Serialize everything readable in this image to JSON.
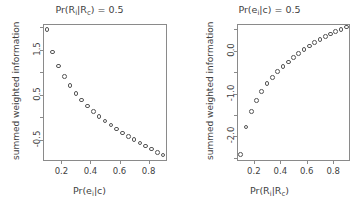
{
  "figure": {
    "background": "#ffffff",
    "point_color": "#555555",
    "frame_color": "#8a8a8a",
    "text_color": "#3f3f3f"
  },
  "chart_data": [
    {
      "type": "scatter",
      "panel": "left",
      "title": "Pr(R_i|R_c) = 0.5",
      "title_parts": {
        "prefix": "Pr(R",
        "sub1": "i",
        "mid": "|R",
        "sub2": "c",
        "suffix": ") = 0.5"
      },
      "xlabel": "Pr(e_i|c)",
      "xlabel_parts": {
        "prefix": "Pr(e",
        "sub1": "i",
        "suffix": "|c)"
      },
      "ylabel": "summed weighted information",
      "marker": "open-circle",
      "grid": false,
      "legend": null,
      "xlim": [
        0.08,
        0.92
      ],
      "ylim": [
        -0.95,
        2.05
      ],
      "xticks": [
        0.2,
        0.4,
        0.6,
        0.8
      ],
      "xticklabels": [
        "0.2",
        "0.4",
        "0.6",
        "0.8"
      ],
      "yticks": [
        -0.5,
        0.5,
        1.5
      ],
      "yticklabels": [
        "-0.5",
        "0.5",
        "1.5"
      ],
      "yticks_minor": [
        -1.0,
        0.0,
        1.0,
        2.0
      ],
      "x": [
        0.1,
        0.14,
        0.18,
        0.22,
        0.26,
        0.3,
        0.34,
        0.38,
        0.42,
        0.46,
        0.5,
        0.54,
        0.58,
        0.62,
        0.66,
        0.7,
        0.74,
        0.78,
        0.82,
        0.86,
        0.9
      ],
      "y": [
        1.95,
        1.45,
        1.14,
        0.9,
        0.7,
        0.53,
        0.38,
        0.25,
        0.13,
        0.02,
        -0.08,
        -0.17,
        -0.26,
        -0.35,
        -0.43,
        -0.5,
        -0.57,
        -0.64,
        -0.71,
        -0.78,
        -0.84
      ]
    },
    {
      "type": "scatter",
      "panel": "right",
      "title": "Pr(e_i|c) = 0.5",
      "title_parts": {
        "prefix": "Pr(e",
        "sub1": "i",
        "mid": "|c",
        "sub2": "",
        "suffix": ") = 0.5"
      },
      "xlabel": "Pr(R_i|R_c)",
      "xlabel_parts": {
        "prefix": "Pr(R",
        "sub1": "i",
        "mid": "|R",
        "sub2": "c",
        "suffix": ")"
      },
      "ylabel": "summed weighted information",
      "marker": "open-circle",
      "grid": false,
      "legend": null,
      "xlim": [
        0.08,
        0.92
      ],
      "ylim": [
        -2.55,
        0.6
      ],
      "xticks": [
        0.2,
        0.4,
        0.6,
        0.8
      ],
      "xticklabels": [
        "0.2",
        "0.4",
        "0.6",
        "0.8"
      ],
      "yticks": [
        -2.0,
        -1.0,
        0.0
      ],
      "yticklabels": [
        "-2.0",
        "-1.0",
        "0.0"
      ],
      "yticks_minor": [
        -2.5,
        -1.5,
        -0.5,
        0.5
      ],
      "x": [
        0.1,
        0.14,
        0.18,
        0.22,
        0.26,
        0.3,
        0.34,
        0.38,
        0.42,
        0.46,
        0.5,
        0.54,
        0.58,
        0.62,
        0.66,
        0.7,
        0.74,
        0.78,
        0.82,
        0.86,
        0.9
      ],
      "y": [
        -2.42,
        -1.78,
        -1.42,
        -1.16,
        -0.95,
        -0.77,
        -0.62,
        -0.49,
        -0.37,
        -0.26,
        -0.16,
        -0.06,
        0.03,
        0.11,
        0.19,
        0.26,
        0.33,
        0.39,
        0.45,
        0.5,
        0.55
      ]
    }
  ]
}
